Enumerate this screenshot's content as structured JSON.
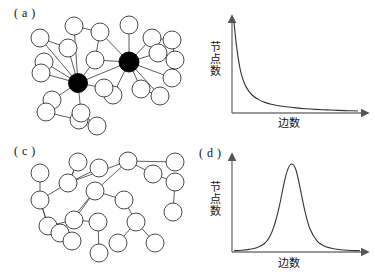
{
  "figure": {
    "background_color": "#ffffff",
    "line_color": "#333333",
    "hub_fill_color": "#000000",
    "node_fill_color": "#ffffff"
  },
  "panels": {
    "a": {
      "label": "( a )",
      "caption_type": "scale-free-network-graph",
      "node_count": 27,
      "hub_count": 2
    },
    "b": {
      "label": "( b )",
      "ylabel": "节点数",
      "xlabel": "边数"
    },
    "c": {
      "label": "( c )",
      "caption_type": "random-network-graph",
      "node_count": 26,
      "hub_count": 0
    },
    "d": {
      "label": "( d )",
      "ylabel": "节点数",
      "xlabel": "边数"
    }
  },
  "chart_data": [
    {
      "id": "panel-b",
      "type": "line",
      "title": "( b )",
      "xlabel": "边数",
      "ylabel": "节点数",
      "legend": [],
      "grid": false,
      "xlim": [
        0,
        100
      ],
      "ylim": [
        0,
        100
      ],
      "axis_ticks": false,
      "distribution": "power-law",
      "x": [
        0,
        2,
        4,
        6,
        8,
        10,
        13,
        16,
        20,
        25,
        30,
        36,
        42,
        50,
        58,
        66,
        75,
        84,
        92,
        100
      ],
      "y": [
        100,
        74,
        55,
        42,
        34,
        28,
        22,
        18,
        14.5,
        11.5,
        9.5,
        7.8,
        6.6,
        5.4,
        4.5,
        3.8,
        3.2,
        2.7,
        2.3,
        2.0
      ]
    },
    {
      "id": "panel-d",
      "type": "line",
      "title": "( d )",
      "xlabel": "边数",
      "ylabel": "节点数",
      "legend": [],
      "grid": false,
      "xlim": [
        0,
        100
      ],
      "ylim": [
        0,
        100
      ],
      "axis_ticks": false,
      "distribution": "gaussian",
      "peak_x": 46,
      "x": [
        0,
        6,
        12,
        18,
        24,
        28,
        32,
        36,
        40,
        43,
        46,
        49,
        52,
        56,
        60,
        66,
        72,
        80,
        90,
        100
      ],
      "y": [
        1.0,
        1.5,
        2.5,
        4.5,
        9,
        16,
        30,
        52,
        80,
        95,
        100,
        94,
        76,
        48,
        27,
        12,
        6,
        3,
        1.5,
        1.0
      ]
    }
  ]
}
